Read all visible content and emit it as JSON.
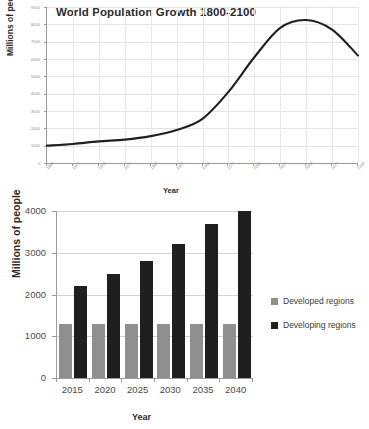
{
  "chart_data": [
    {
      "type": "line",
      "title": "World Population Growth 1800-2100",
      "xlabel": "Year",
      "ylabel": "Millions of people",
      "xlim": [
        1800,
        2100
      ],
      "ylim": [
        0,
        9000
      ],
      "grid": true,
      "legend_position": "none",
      "line_color": "#1f1f1f",
      "x": [
        1800,
        1825,
        1850,
        1875,
        1900,
        1925,
        1950,
        1975,
        2000,
        2025,
        2050,
        2075,
        2100
      ],
      "y": [
        1000,
        1100,
        1250,
        1350,
        1550,
        1900,
        2550,
        4100,
        6100,
        7800,
        8250,
        7700,
        6200
      ],
      "xticklabels": [
        "1800",
        "1825",
        "1850",
        "1875",
        "1900",
        "1925",
        "1950",
        "1975",
        "2000",
        "2025",
        "2050",
        "2075",
        "2100"
      ],
      "yticklabels": [
        "0",
        "1000",
        "2000",
        "3000",
        "4000",
        "5000",
        "6000",
        "7000",
        "8000",
        "9000"
      ],
      "yticks": [
        0,
        1000,
        2000,
        3000,
        4000,
        5000,
        6000,
        7000,
        8000,
        9000
      ]
    },
    {
      "type": "bar",
      "title": "",
      "xlabel": "Year",
      "ylabel": "Millions of people",
      "ylim": [
        0,
        4000
      ],
      "grid": true,
      "legend_position": "right",
      "categories": [
        "2015",
        "2020",
        "2025",
        "2030",
        "2035",
        "2040"
      ],
      "yticklabels": [
        "0",
        "1000",
        "2000",
        "3000",
        "4000"
      ],
      "yticks": [
        0,
        1000,
        2000,
        3000,
        4000
      ],
      "series": [
        {
          "name": "Developed regions",
          "color": "#8f8f8f",
          "values": [
            1300,
            1300,
            1300,
            1300,
            1300,
            1300
          ]
        },
        {
          "name": "Developing regions",
          "color": "#1f1f1f",
          "values": [
            2200,
            2500,
            2800,
            3200,
            3700,
            4000
          ]
        }
      ]
    }
  ]
}
